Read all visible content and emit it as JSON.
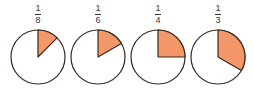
{
  "colors": {
    "fill": "#f4986a",
    "stroke": "#3a2a22",
    "background": "#ffffff"
  },
  "fractions": [
    {
      "numerator": "1",
      "denominator": "8",
      "value": 0.125
    },
    {
      "numerator": "1",
      "denominator": "6",
      "value": 0.1667
    },
    {
      "numerator": "1",
      "denominator": "4",
      "value": 0.25
    },
    {
      "numerator": "1",
      "denominator": "3",
      "value": 0.3333
    }
  ]
}
